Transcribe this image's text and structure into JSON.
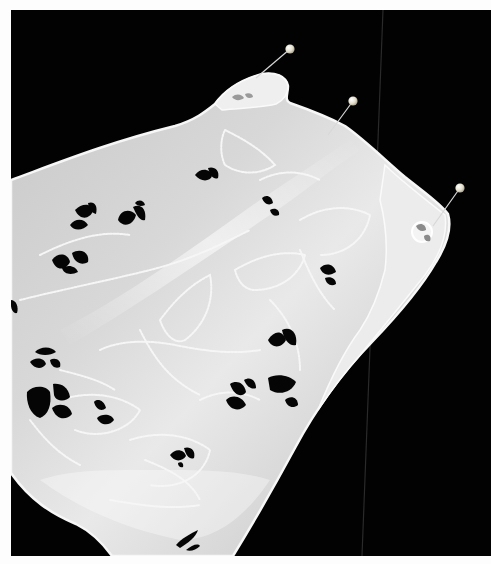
{
  "image": {
    "subject": "white eyelet embroidered fabric pinned on black background",
    "colors": {
      "background": "#020202",
      "border": "#fdfdfd",
      "fabric_light": "#f2f2f2",
      "fabric_mid": "#cfcfcf",
      "fabric_shadow": "#a9a9a9",
      "eyelet_hole": "#050505",
      "stitch": "#f8f8f8",
      "pin_head": "#e6e2d2",
      "pin_shaft": "#d8d8d8"
    },
    "pins": [
      {
        "name": "pin-1",
        "head": [
          290,
          49
        ],
        "tip": [
          256,
          78
        ]
      },
      {
        "name": "pin-2",
        "head": [
          353,
          101
        ],
        "tip": [
          328,
          135
        ]
      },
      {
        "name": "pin-3",
        "head": [
          460,
          188
        ],
        "tip": [
          433,
          226
        ]
      }
    ]
  }
}
